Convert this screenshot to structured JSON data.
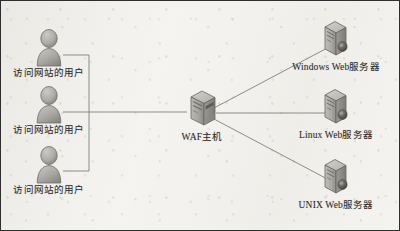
{
  "diagram": {
    "type": "network-topology",
    "colors": {
      "background": "#f5f4f1",
      "border": "#2e2e2e",
      "edge_line": "#8d8b86",
      "icon_fill": "#b4b2ad",
      "icon_shade": "#8f8d88",
      "icon_outline": "#6f6d69",
      "label_text": "#2b2a28"
    },
    "clients": [
      {
        "id": "client-1",
        "label": "访问网站的用户",
        "icon": "user-icon"
      },
      {
        "id": "client-2",
        "label": "访问网站的用户",
        "icon": "user-icon"
      },
      {
        "id": "client-3",
        "label": "访问网站的用户",
        "icon": "user-icon"
      }
    ],
    "gateway": {
      "id": "waf-host",
      "label": "WAF主机",
      "icon": "server-tower-icon"
    },
    "servers": [
      {
        "id": "windows-web-server",
        "label": "Windows Web服务器",
        "icon": "server-tower-icon"
      },
      {
        "id": "linux-web-server",
        "label": "Linux Web服务器",
        "icon": "server-tower-icon"
      },
      {
        "id": "unix-web-server",
        "label": "UNIX Web服务器",
        "icon": "server-tower-icon"
      }
    ],
    "connections": [
      {
        "from": "client-1",
        "to": "waf-host",
        "style": "orthogonal"
      },
      {
        "from": "client-2",
        "to": "waf-host",
        "style": "straight"
      },
      {
        "from": "client-3",
        "to": "waf-host",
        "style": "orthogonal"
      },
      {
        "from": "waf-host",
        "to": "windows-web-server",
        "style": "diagonal"
      },
      {
        "from": "waf-host",
        "to": "linux-web-server",
        "style": "straight"
      },
      {
        "from": "waf-host",
        "to": "unix-web-server",
        "style": "diagonal"
      }
    ]
  }
}
